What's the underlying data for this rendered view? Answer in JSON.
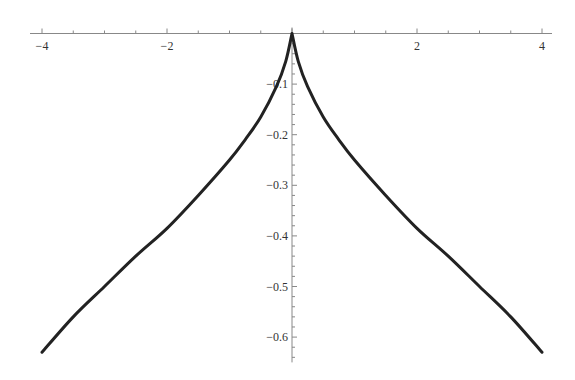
{
  "chart_data": {
    "type": "line",
    "title": "",
    "xlabel": "",
    "ylabel": "",
    "xlim": [
      -4,
      4
    ],
    "ylim": [
      -0.65,
      0
    ],
    "grid": false,
    "legend": null,
    "x_ticks": [
      {
        "value": -4,
        "label": "−4"
      },
      {
        "value": -2,
        "label": "−2"
      },
      {
        "value": 2,
        "label": "2"
      },
      {
        "value": 4,
        "label": "4"
      }
    ],
    "y_ticks": [
      {
        "value": -0.1,
        "label": "−0.1"
      },
      {
        "value": -0.2,
        "label": "−0.2"
      },
      {
        "value": -0.3,
        "label": "−0.3"
      },
      {
        "value": -0.4,
        "label": "−0.4"
      },
      {
        "value": -0.5,
        "label": "−0.5"
      },
      {
        "value": -0.6,
        "label": "−0.6"
      }
    ],
    "series": [
      {
        "name": "curve",
        "color": "#222222",
        "x": [
          -4,
          -3.5,
          -3,
          -2.5,
          -2,
          -1.5,
          -1,
          -0.75,
          -0.5,
          -0.25,
          -0.1,
          0,
          0.1,
          0.25,
          0.5,
          0.75,
          1,
          1.5,
          2,
          2.5,
          3,
          3.5,
          4
        ],
        "y": [
          -0.63,
          -0.56,
          -0.5,
          -0.44,
          -0.385,
          -0.32,
          -0.25,
          -0.21,
          -0.165,
          -0.105,
          -0.055,
          0,
          -0.055,
          -0.105,
          -0.165,
          -0.21,
          -0.25,
          -0.32,
          -0.385,
          -0.44,
          -0.5,
          -0.56,
          -0.63
        ]
      }
    ]
  }
}
